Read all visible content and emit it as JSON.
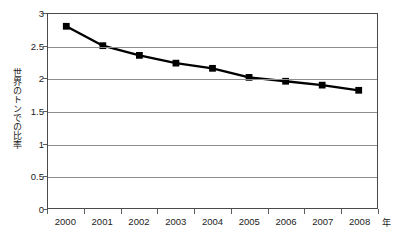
{
  "chart_data": {
    "type": "line",
    "title": "",
    "subtitle": "",
    "xlabel": "年",
    "ylabel": "世界のトンでの比率",
    "categories": [
      "2000",
      "2001",
      "2002",
      "2003",
      "2004",
      "2005",
      "2006",
      "2007",
      "2008"
    ],
    "x": [
      2000,
      2001,
      2002,
      2003,
      2004,
      2005,
      2006,
      2007,
      2008
    ],
    "values": [
      2.81,
      2.51,
      2.36,
      2.24,
      2.16,
      2.02,
      1.96,
      1.9,
      1.82
    ],
    "series": [
      {
        "name": "世界のトンでの比率",
        "values": [
          2.81,
          2.51,
          2.36,
          2.24,
          2.16,
          2.02,
          1.96,
          1.9,
          1.82
        ]
      }
    ],
    "ylim": [
      0,
      3
    ],
    "ytick_values": [
      3,
      2.5,
      2,
      1.5,
      1,
      0.5,
      0
    ],
    "ytick_labels": [
      "3",
      "2.5",
      "2",
      "1.5",
      "1",
      "0.5",
      "0"
    ],
    "xtick_labels": [
      "2000",
      "2001",
      "2002",
      "2003",
      "2004",
      "2005",
      "2006",
      "2007",
      "2008"
    ],
    "grid": "horizontal",
    "legend": "none",
    "marker": "square",
    "line_color": "#000000",
    "marker_color": "#000000",
    "grid_color": "#8d8d8d",
    "axis_color": "#4a4a4a",
    "background_color": "#ffffff",
    "annotations": []
  },
  "axes": {
    "y_title": "世界のトンでの比率",
    "x_unit": "年",
    "y_ticks": [
      {
        "label": "3",
        "value": 3
      },
      {
        "label": "2.5",
        "value": 2.5
      },
      {
        "label": "2",
        "value": 2
      },
      {
        "label": "1.5",
        "value": 1.5
      },
      {
        "label": "1",
        "value": 1
      },
      {
        "label": "0.5",
        "value": 0.5
      },
      {
        "label": "0",
        "value": 0
      }
    ],
    "x_ticks": [
      {
        "label": "2000",
        "value": 2000
      },
      {
        "label": "2001",
        "value": 2001
      },
      {
        "label": "2002",
        "value": 2002
      },
      {
        "label": "2003",
        "value": 2003
      },
      {
        "label": "2004",
        "value": 2004
      },
      {
        "label": "2005",
        "value": 2005
      },
      {
        "label": "2006",
        "value": 2006
      },
      {
        "label": "2007",
        "value": 2007
      },
      {
        "label": "2008",
        "value": 2008
      }
    ]
  }
}
